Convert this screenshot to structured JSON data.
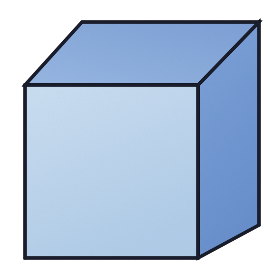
{
  "figure": {
    "name": "cube",
    "background_color": "#ffffff",
    "canvas": {
      "width": 270,
      "height": 271
    }
  },
  "style": {
    "edge_color": "#1a1d2b",
    "edge_width": 3,
    "front_fill_top": "#e3eef8",
    "front_fill_bottom": "#d4e4f3",
    "top_fill_left": "#c4d8f0",
    "top_fill_right": "#b2c9e9",
    "right_fill_top": "#b3cbeb",
    "right_fill_bottom": "#a3bfe4"
  },
  "geometry": {
    "vertices": {
      "front_top_left": {
        "x": 25,
        "y": 85
      },
      "front_top_right": {
        "x": 198,
        "y": 85
      },
      "front_bottom_right": {
        "x": 198,
        "y": 258
      },
      "front_bottom_left": {
        "x": 25,
        "y": 258
      },
      "back_top_left": {
        "x": 82,
        "y": 22
      },
      "back_top_right": {
        "x": 259,
        "y": 22
      },
      "back_bottom_right": {
        "x": 259,
        "y": 225
      }
    },
    "faces": [
      {
        "name": "front-face",
        "label": "Front face",
        "points": "25,85 198,85 198,258 25,258"
      },
      {
        "name": "top-face",
        "label": "Top face",
        "points": "25,85 82,22 259,22 198,85"
      },
      {
        "name": "right-face",
        "label": "Right face",
        "points": "198,85 259,22 259,225 198,258"
      }
    ],
    "edges": [
      {
        "name": "edge-front-top",
        "x1": 25,
        "y1": 85,
        "x2": 198,
        "y2": 85
      },
      {
        "name": "edge-front-right",
        "x1": 198,
        "y1": 85,
        "x2": 198,
        "y2": 258
      },
      {
        "name": "edge-front-bottom",
        "x1": 198,
        "y1": 258,
        "x2": 25,
        "y2": 258
      },
      {
        "name": "edge-front-left",
        "x1": 25,
        "y1": 258,
        "x2": 25,
        "y2": 85
      },
      {
        "name": "edge-top-left-slant",
        "x1": 25,
        "y1": 85,
        "x2": 82,
        "y2": 22
      },
      {
        "name": "edge-top-back",
        "x1": 82,
        "y1": 22,
        "x2": 259,
        "y2": 22
      },
      {
        "name": "edge-top-right-slant",
        "x1": 259,
        "y1": 22,
        "x2": 198,
        "y2": 85
      },
      {
        "name": "edge-right-back",
        "x1": 259,
        "y1": 22,
        "x2": 259,
        "y2": 225
      },
      {
        "name": "edge-right-bottom",
        "x1": 259,
        "y1": 225,
        "x2": 198,
        "y2": 258
      }
    ]
  }
}
